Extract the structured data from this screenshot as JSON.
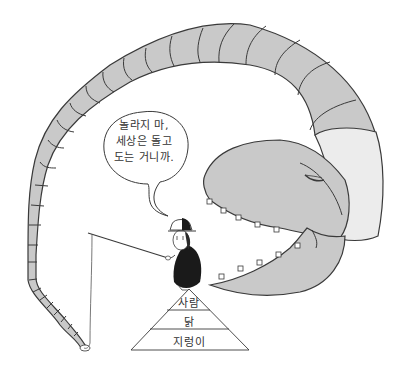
{
  "illustration": {
    "speech_bubble": {
      "lines": [
        "놀라지 마,",
        "세상은 돌고",
        "도는 거니까."
      ]
    },
    "pyramid": {
      "tiers": [
        "사람",
        "닭",
        "지렁이"
      ]
    },
    "colors": {
      "worm_body": "#c9c9c9",
      "worm_collar": "#ececec",
      "outline": "#3a3a3a",
      "background": "#ffffff"
    }
  }
}
